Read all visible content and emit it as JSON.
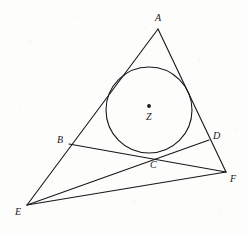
{
  "figure": {
    "kind": "euclidean-geometry-diagram",
    "canvas": {
      "width": 249,
      "height": 234
    },
    "background_color": "#fdfdfc",
    "ink_color": "#17171a",
    "stroke_width": 1.1
  },
  "points": [
    {
      "id": "A",
      "label": "A",
      "x": 158,
      "y": 29,
      "label_x": 155,
      "label_y": 13,
      "marked_dot": false,
      "role": "triangle-apex"
    },
    {
      "id": "B",
      "label": "B",
      "x": 69,
      "y": 144,
      "label_x": 57,
      "label_y": 135,
      "marked_dot": false,
      "role": "point-on-side-AE"
    },
    {
      "id": "C",
      "label": "C",
      "x": 152,
      "y": 157,
      "label_x": 150,
      "label_y": 160,
      "marked_dot": false,
      "role": "intersection-and-tangency"
    },
    {
      "id": "D",
      "label": "D",
      "x": 209,
      "y": 140,
      "label_x": 213,
      "label_y": 131,
      "marked_dot": false,
      "role": "point-on-side-AF"
    },
    {
      "id": "E",
      "label": "E",
      "x": 27,
      "y": 205,
      "label_x": 15,
      "label_y": 207,
      "marked_dot": false,
      "role": "triangle-vertex-left"
    },
    {
      "id": "F",
      "label": "F",
      "x": 226,
      "y": 172,
      "label_x": 230,
      "label_y": 174,
      "marked_dot": false,
      "role": "triangle-vertex-right"
    },
    {
      "id": "Z",
      "label": "Z",
      "x": 149,
      "y": 106,
      "label_x": 146,
      "label_y": 112,
      "marked_dot": true,
      "role": "incircle-center"
    }
  ],
  "circle": {
    "id": "incircle",
    "center_label": "Z",
    "cx": 149,
    "cy": 110,
    "r": 43,
    "filled": false
  },
  "segments": [
    {
      "id": "AE",
      "from": "A",
      "to": "E",
      "role": "triangle-side-left"
    },
    {
      "id": "AF",
      "from": "A",
      "to": "F",
      "role": "triangle-side-right"
    },
    {
      "id": "EF",
      "from": "E",
      "to": "F",
      "role": "triangle-side-base"
    },
    {
      "id": "BF",
      "from": "B",
      "to": "F",
      "role": "transversal-through-C"
    },
    {
      "id": "ED",
      "from": "E",
      "to": "D",
      "role": "transversal-through-C"
    }
  ],
  "center_dot": {
    "cx": 149,
    "cy": 106,
    "r": 1.9
  }
}
